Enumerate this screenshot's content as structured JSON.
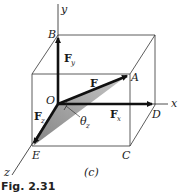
{
  "figure": {
    "caption": "Fig. 2.31",
    "panel_label": "(c)",
    "axes": {
      "x": "x",
      "y": "y",
      "z": "z"
    },
    "points": {
      "O": "O",
      "A": "A",
      "B": "B",
      "C": "C",
      "D": "D",
      "E": "E"
    },
    "vectors": {
      "F": "F",
      "Fx": {
        "base": "F",
        "sub": "x"
      },
      "Fy": {
        "base": "F",
        "sub": "y"
      },
      "Fz": {
        "base": "F",
        "sub": "z"
      }
    },
    "angle": {
      "base": "θ",
      "sub": "z"
    },
    "colors": {
      "ink": "#111111",
      "shade": "#8a8a8a",
      "background": "#ffffff"
    }
  }
}
